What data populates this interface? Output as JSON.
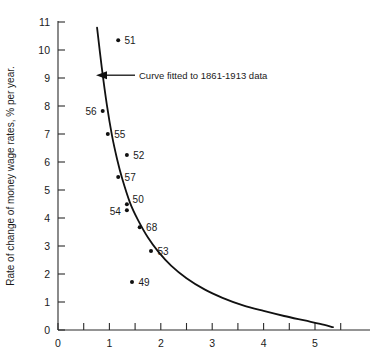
{
  "chart_data": {
    "type": "scatter",
    "title": "",
    "xlabel": "",
    "ylabel": "Rate of change of money wage rates, % per year.",
    "xlim": [
      0,
      5.6
    ],
    "ylim": [
      0,
      11
    ],
    "xticks": [
      0,
      1,
      2,
      3,
      4,
      5
    ],
    "xtick_labels": [
      "0",
      "1",
      "2",
      "3",
      "4",
      "5"
    ],
    "xminor_ticks": [
      0.5,
      1.5,
      2.5,
      3.5,
      4.5,
      5.5
    ],
    "yticks": [
      0,
      1,
      2,
      3,
      4,
      5,
      6,
      7,
      8,
      9,
      10,
      11
    ],
    "ytick_labels": [
      "0",
      "1",
      "2",
      "3",
      "4",
      "5",
      "6",
      "7",
      "8",
      "9",
      "10",
      "11"
    ],
    "grid": false,
    "legend": "none",
    "points": [
      {
        "label": "51",
        "x": 1.17,
        "y": 10.35,
        "label_pos": "right"
      },
      {
        "label": "56",
        "x": 0.87,
        "y": 7.82,
        "label_pos": "left"
      },
      {
        "label": "55",
        "x": 0.97,
        "y": 7.0,
        "label_pos": "right"
      },
      {
        "label": "52",
        "x": 1.34,
        "y": 6.25,
        "label_pos": "right"
      },
      {
        "label": "57",
        "x": 1.17,
        "y": 5.46,
        "label_pos": "right"
      },
      {
        "label": "50",
        "x": 1.34,
        "y": 4.49,
        "label_pos": "upper-right"
      },
      {
        "label": "54",
        "x": 1.34,
        "y": 4.28,
        "label_pos": "left"
      },
      {
        "label": "68",
        "x": 1.59,
        "y": 3.67,
        "label_pos": "right"
      },
      {
        "label": "53",
        "x": 1.81,
        "y": 2.82,
        "label_pos": "right"
      },
      {
        "label": "49",
        "x": 1.44,
        "y": 1.71,
        "label_pos": "right"
      }
    ],
    "series": [
      {
        "name": "Curve fitted to 1861-1913 data",
        "type": "line",
        "x": [
          0.76,
          0.85,
          0.95,
          1.05,
          1.15,
          1.25,
          1.4,
          1.55,
          1.75,
          1.95,
          2.2,
          2.5,
          2.85,
          3.2,
          3.6,
          4.0,
          4.4,
          4.8,
          5.1,
          5.35
        ],
        "y": [
          10.8,
          9.4,
          8.05,
          6.95,
          6.1,
          5.4,
          4.55,
          3.95,
          3.3,
          2.8,
          2.3,
          1.85,
          1.45,
          1.15,
          0.88,
          0.68,
          0.5,
          0.34,
          0.22,
          0.1
        ]
      }
    ],
    "annotations": [
      {
        "text": "Curve fitted to 1861-1913 data",
        "x": 1.5,
        "y": 9.1,
        "arrow_to_x": 0.85,
        "arrow_to_y": 9.1
      }
    ]
  },
  "colors": {
    "axis": "#2b2b2b",
    "curve": "#111111",
    "point": "#111111",
    "text": "#1a1a1a",
    "background": "#ffffff"
  }
}
